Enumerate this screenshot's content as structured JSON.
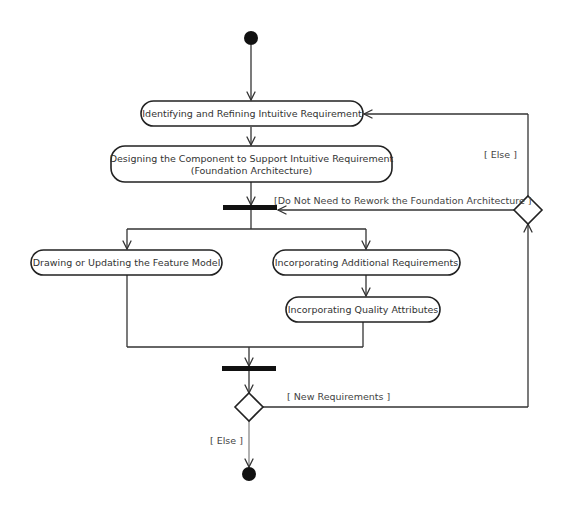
{
  "diagram": {
    "type": "uml-activity-diagram",
    "colors": {
      "line": "#333333",
      "node_fill": "#ffffff",
      "node_stroke": "#222222",
      "bar": "#111111",
      "text": "#333333"
    },
    "start_node": {
      "cx": 251,
      "cy": 38,
      "r": 7
    },
    "end_node": {
      "cx": 249,
      "cy": 474,
      "r": 7
    },
    "actions": [
      {
        "id": "identify",
        "lines": [
          "Identifying and Refining Intuitive Requirement"
        ],
        "x": 141,
        "y": 101,
        "w": 222,
        "h": 25
      },
      {
        "id": "design",
        "lines": [
          "Designing the Component to Support Intuitive Requirement",
          "(Foundation Architecture)"
        ],
        "x": 111,
        "y": 146,
        "w": 281,
        "h": 36
      },
      {
        "id": "feature",
        "lines": [
          "Drawing or Updating the Feature Model"
        ],
        "x": 31,
        "y": 250,
        "w": 191,
        "h": 25
      },
      {
        "id": "additional",
        "lines": [
          "Incorporating Additional Requirements"
        ],
        "x": 273,
        "y": 250,
        "w": 187,
        "h": 25
      },
      {
        "id": "quality",
        "lines": [
          "Incorporating Quality Attributes"
        ],
        "x": 286,
        "y": 297,
        "w": 154,
        "h": 25
      }
    ],
    "fork_bar": {
      "x": 223,
      "y": 205,
      "w": 54,
      "h": 5
    },
    "join_bar": {
      "x": 222,
      "y": 366,
      "w": 54,
      "h": 5
    },
    "decisions": [
      {
        "id": "rework-decision",
        "cx": 528,
        "cy": 210,
        "r": 14
      },
      {
        "id": "new-req-decision",
        "cx": 249,
        "cy": 407,
        "r": 14
      }
    ],
    "guards": {
      "else_top": {
        "text": "[ Else ]",
        "x": 484,
        "y": 158
      },
      "no_rework": {
        "text": "[Do Not Need  to Rework the Foundation Architecture ]",
        "x": 274,
        "y": 204
      },
      "new_requirements": {
        "text": "[ New Requirements ]",
        "x": 287,
        "y": 400
      },
      "else_bottom": {
        "text": "[ Else ]",
        "x": 210,
        "y": 444
      }
    }
  }
}
